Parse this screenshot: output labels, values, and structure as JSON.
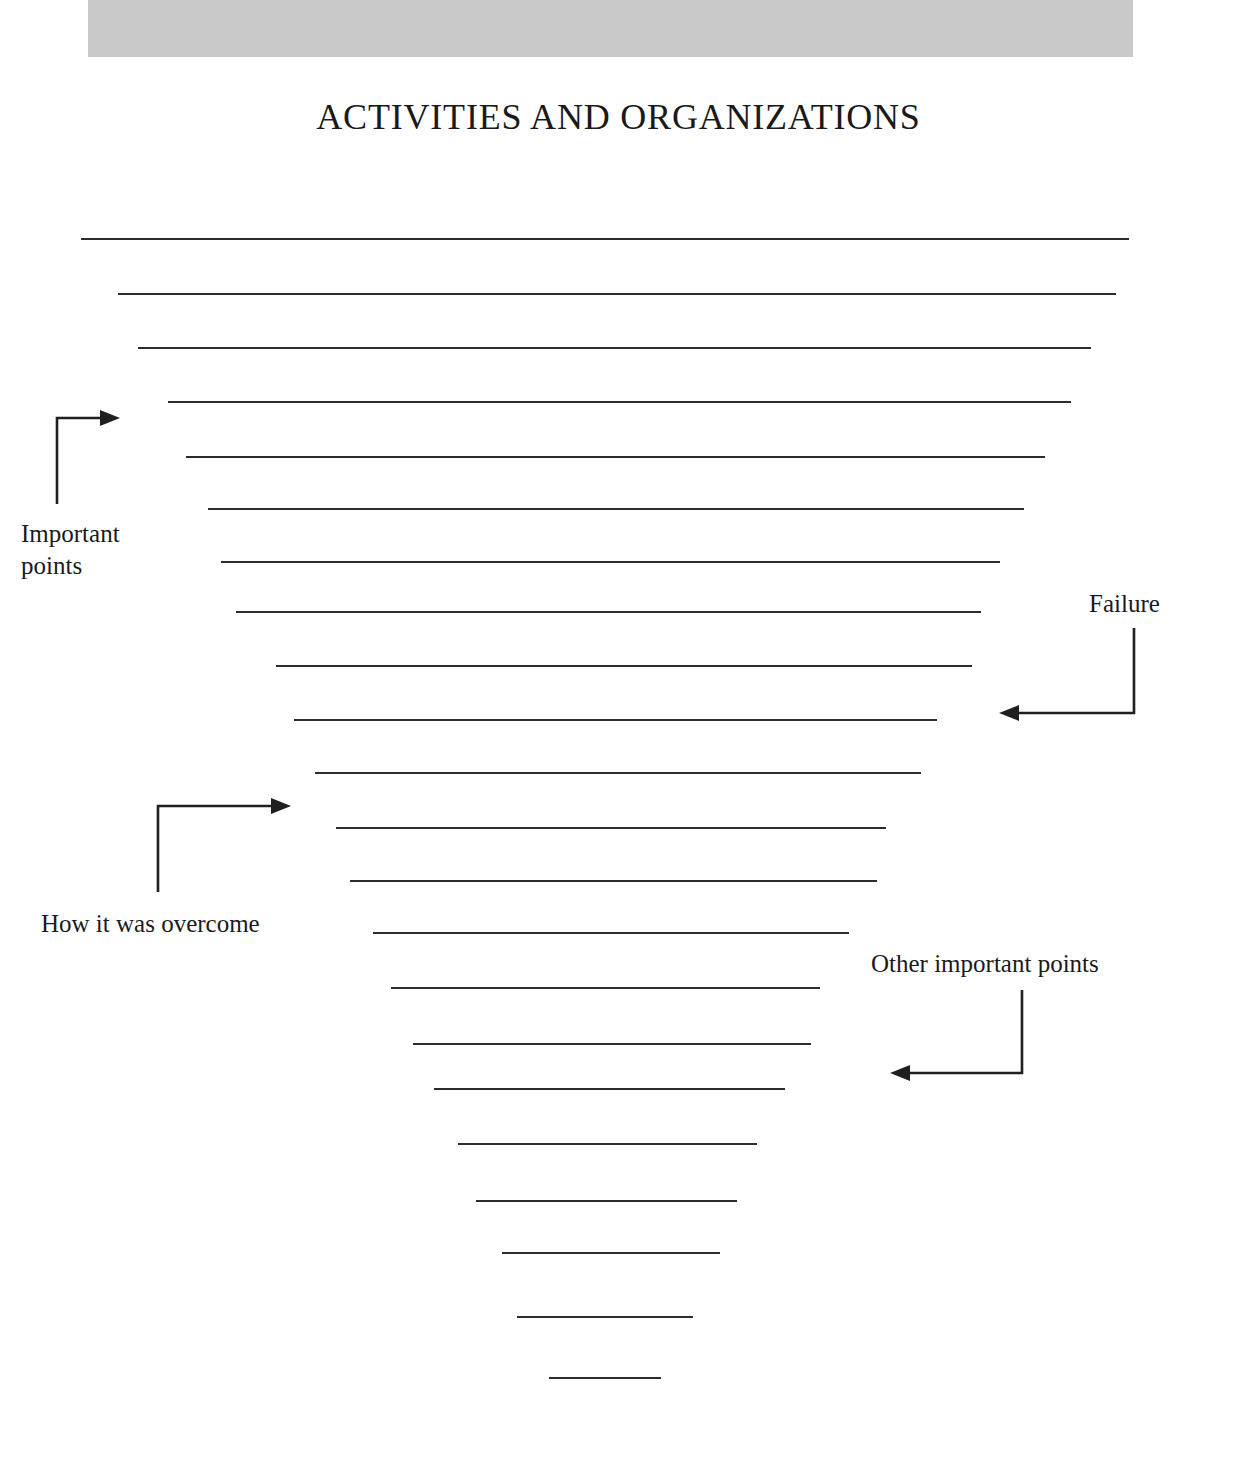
{
  "document": {
    "title": "ACTIVITIES AND ORGANIZATIONS",
    "type": "lined worksheet page",
    "paper_color": "#ffffff",
    "header_band_color": "#c9c9c9",
    "rule_color": "#2c2c2c"
  },
  "header": {
    "band_label": "gray header band",
    "title": "ACTIVITIES AND ORGANIZATIONS"
  },
  "annotations": [
    {
      "id": "important-points",
      "text": "Important\npoints",
      "arrow_direction": "right",
      "arrow_shape": "elbow-up-right",
      "position": "left"
    },
    {
      "id": "failure",
      "text": "Failure",
      "arrow_direction": "left",
      "arrow_shape": "elbow-down-left",
      "position": "right"
    },
    {
      "id": "how-it-was-overcome",
      "text": "How it was overcome",
      "arrow_direction": "right",
      "arrow_shape": "elbow-up-right",
      "position": "left"
    },
    {
      "id": "other-important-points",
      "text": "Other important points",
      "arrow_direction": "left",
      "arrow_shape": "elbow-down-left",
      "position": "right"
    }
  ],
  "writing_lines": [
    {
      "index": 1,
      "x1": 81,
      "x2": 1129,
      "y": 238
    },
    {
      "index": 2,
      "x1": 118,
      "x2": 1116,
      "y": 293
    },
    {
      "index": 3,
      "x1": 138,
      "x2": 1091,
      "y": 347
    },
    {
      "index": 4,
      "x1": 168,
      "x2": 1071,
      "y": 401
    },
    {
      "index": 5,
      "x1": 186,
      "x2": 1045,
      "y": 456
    },
    {
      "index": 6,
      "x1": 208,
      "x2": 1024,
      "y": 508
    },
    {
      "index": 7,
      "x1": 221,
      "x2": 1000,
      "y": 561
    },
    {
      "index": 8,
      "x1": 236,
      "x2": 981,
      "y": 611
    },
    {
      "index": 9,
      "x1": 276,
      "x2": 972,
      "y": 665
    },
    {
      "index": 10,
      "x1": 294,
      "x2": 937,
      "y": 719
    },
    {
      "index": 11,
      "x1": 315,
      "x2": 921,
      "y": 772
    },
    {
      "index": 12,
      "x1": 336,
      "x2": 886,
      "y": 827
    },
    {
      "index": 13,
      "x1": 350,
      "x2": 877,
      "y": 880
    },
    {
      "index": 14,
      "x1": 373,
      "x2": 849,
      "y": 932
    },
    {
      "index": 15,
      "x1": 391,
      "x2": 820,
      "y": 987
    },
    {
      "index": 16,
      "x1": 413,
      "x2": 811,
      "y": 1043
    },
    {
      "index": 17,
      "x1": 434,
      "x2": 785,
      "y": 1088
    },
    {
      "index": 18,
      "x1": 458,
      "x2": 757,
      "y": 1143
    },
    {
      "index": 19,
      "x1": 476,
      "x2": 737,
      "y": 1200
    },
    {
      "index": 20,
      "x1": 502,
      "x2": 720,
      "y": 1252
    },
    {
      "index": 21,
      "x1": 517,
      "x2": 693,
      "y": 1316
    },
    {
      "index": 22,
      "x1": 549,
      "x2": 661,
      "y": 1377
    }
  ]
}
